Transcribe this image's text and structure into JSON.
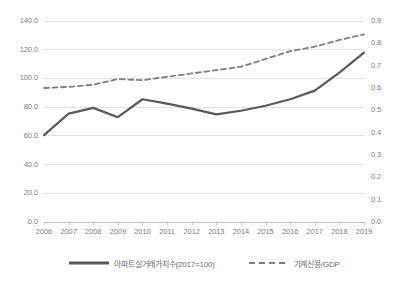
{
  "chart_data": {
    "type": "line",
    "title": "",
    "xlabel": "",
    "ylabel": "",
    "grid": true,
    "legend_position": "bottom",
    "categories": [
      "2006",
      "2007",
      "2008",
      "2009",
      "2010",
      "2011",
      "2012",
      "2013",
      "2014",
      "2015",
      "2016",
      "2017",
      "2018",
      "2019"
    ],
    "axes": {
      "left": {
        "ylim": [
          0,
          140
        ],
        "ticks": [
          "0.0",
          "20.0",
          "40.0",
          "60.0",
          "80.0",
          "100.0",
          "120.0",
          "140.0"
        ],
        "tick_values": [
          0,
          20,
          40,
          60,
          80,
          100,
          120,
          140
        ]
      },
      "right": {
        "ylim": [
          0,
          0.9
        ],
        "ticks": [
          "0.0",
          "0.1",
          "0.2",
          "0.3",
          "0.4",
          "0.5",
          "0.6",
          "0.7",
          "0.8",
          "0.9"
        ],
        "tick_values": [
          0,
          0.1,
          0.2,
          0.3,
          0.4,
          0.5,
          0.6,
          0.7,
          0.8,
          0.9
        ]
      }
    },
    "series": [
      {
        "name": "아파트실거래가지수(2017=100)",
        "axis": "left",
        "style": "solid",
        "color": "#595959",
        "values": [
          60.5,
          75.5,
          79.5,
          73.0,
          85.5,
          82.5,
          79.0,
          75.0,
          77.5,
          81.0,
          85.5,
          91.5,
          104.0,
          118.0
        ]
      },
      {
        "name": "가계신용/GDP",
        "axis": "right",
        "style": "dashed",
        "color": "#7f7f7f",
        "values": [
          0.6,
          0.605,
          0.615,
          0.64,
          0.635,
          0.65,
          0.665,
          0.68,
          0.695,
          0.73,
          0.765,
          0.785,
          0.815,
          0.84
        ]
      }
    ]
  },
  "legend": {
    "items": [
      {
        "label": "아파트실거래가지수(2017=100)",
        "style": "solid",
        "color": "#595959"
      },
      {
        "label": "가계신용/GDP",
        "style": "dashed",
        "color": "#7f7f7f"
      }
    ]
  },
  "colors": {
    "background": "#ffffff",
    "grid": "#d9d9d9",
    "axis_text": "#808080",
    "series_solid": "#595959",
    "series_dashed": "#7f7f7f"
  }
}
